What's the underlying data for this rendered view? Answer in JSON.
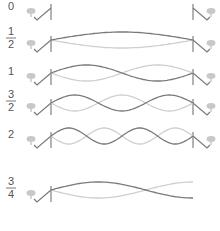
{
  "colors": {
    "dark": "#7a7a7a",
    "light": "#cfcfcf",
    "post": "#9a9a9a",
    "pin": "#c8c8c8",
    "label": "#555555"
  },
  "rows": [
    {
      "label": "0",
      "label_num": "",
      "label_den": "",
      "y": 8,
      "harmonic": 0,
      "cut": true
    },
    {
      "label": "1/2",
      "label_num": "1",
      "label_den": "2",
      "y": 40,
      "harmonic": 0.5
    },
    {
      "label": "1",
      "label_num": "",
      "label_den": "",
      "y": 73,
      "harmonic": 1
    },
    {
      "label": "3/2",
      "label_num": "3",
      "label_den": "2",
      "y": 103,
      "harmonic": 1.5
    },
    {
      "label": "2",
      "label_num": "",
      "label_den": "",
      "y": 136,
      "harmonic": 2
    },
    {
      "label": "3/4",
      "label_num": "3",
      "label_den": "4",
      "y": 190,
      "harmonic": 0.75,
      "open_end": true
    }
  ]
}
